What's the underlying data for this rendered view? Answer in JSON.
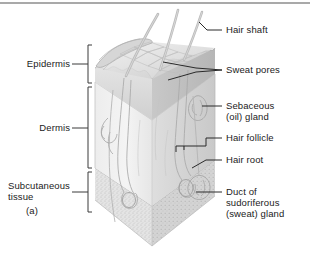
{
  "figure": {
    "panel_letter": "(a)",
    "title_rule": "top-divider"
  },
  "left_labels": [
    {
      "name": "epidermis",
      "text": "Epidermis"
    },
    {
      "name": "dermis",
      "text": "Dermis"
    },
    {
      "name": "subcutaneous",
      "text": "Subcutaneous\ntissue"
    }
  ],
  "right_labels": [
    {
      "name": "hair-shaft",
      "text": "Hair shaft"
    },
    {
      "name": "sweat-pores",
      "text": "Sweat pores"
    },
    {
      "name": "sebaceous",
      "text": "Sebaceous\n(oil) gland"
    },
    {
      "name": "hair-follicle",
      "text": "Hair follicle"
    },
    {
      "name": "hair-root",
      "text": "Hair root"
    },
    {
      "name": "sweat-duct",
      "text": "Duct of\nsudoriferous\n(sweat) gland"
    }
  ],
  "colors": {
    "ink": "#1b1b1b",
    "leader": "#2a2a2a",
    "bracket": "#3a3a3a",
    "rule": "#9a9a9a",
    "front_face": "#f0f0f0",
    "side_face": "#dcdcdc",
    "epidermis_front": "#dadada",
    "epidermis_side": "#c3c3c3",
    "subcut_front": "#e2e2e2",
    "subcut_side": "#cfcfcf",
    "bevel": "#cfcfcf",
    "structure": "#a9a9a9",
    "hair": "#b4b4b4"
  }
}
